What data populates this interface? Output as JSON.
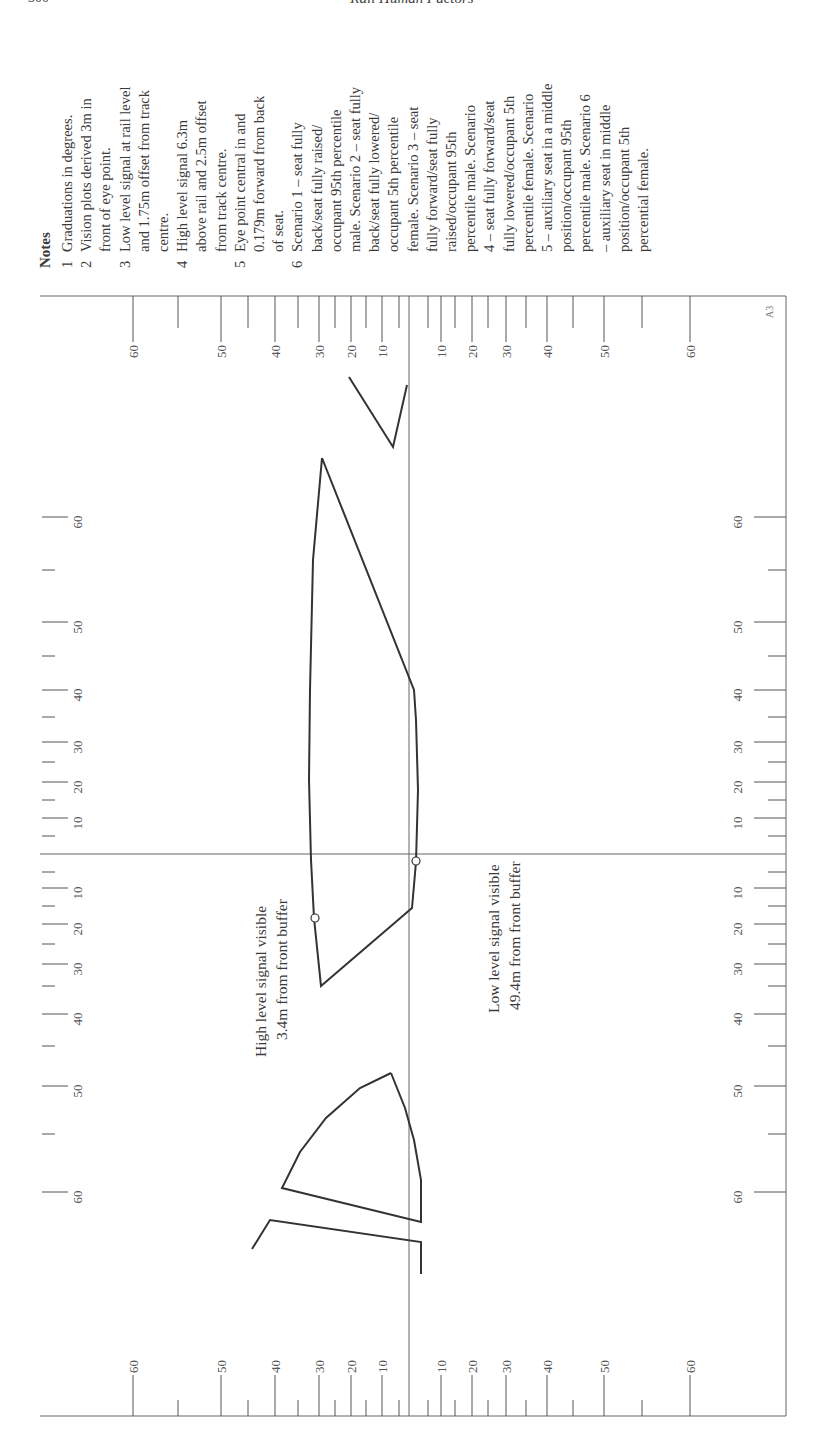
{
  "header": {
    "page_number": "300",
    "running_title": "Rail Human Factors"
  },
  "notes": {
    "heading": "Notes",
    "items": [
      {
        "num": "1",
        "lines": [
          "Graduations in degrees."
        ]
      },
      {
        "num": "2",
        "lines": [
          "Vision plots derived 3m in",
          "front of eye point."
        ]
      },
      {
        "num": "3",
        "lines": [
          "Low level signal at rail level",
          "and 1.75m offset from track",
          "centre."
        ]
      },
      {
        "num": "4",
        "lines": [
          "High level signal 6.3m",
          "above rail and 2.5m offset",
          "from track centre."
        ]
      },
      {
        "num": "5",
        "lines": [
          "Eye point central in and",
          "0.179m forward from back",
          "of seat."
        ]
      },
      {
        "num": "6",
        "lines": [
          "Scenario 1 – seat fully",
          "back/seat fully raised/",
          "occupant 95th percentile",
          "male. Scenario 2 – seat fully",
          "back/seat fully lowered/",
          "occupant 5th percentile",
          "female. Scenario 3 – seat",
          "fully forward/seat fully",
          "raised/occupant 95th",
          "percentile male. Scenario",
          "4 – seat fully forward/seat",
          "fully lowered/occupant 5th",
          "percentile female. Scenario",
          "5 – auxiliary seat in a middle",
          "position/occupant 95th",
          "percentile male. Scenario 6",
          "– auxiliary seat in middle",
          "position/occupant 5th",
          "percential female."
        ]
      }
    ]
  },
  "annotations": {
    "high_signal": [
      "High level signal visible",
      "3.4m from front buffer"
    ],
    "low_signal": [
      "Low level signal visible",
      "49.4m from front buffer"
    ],
    "corner_code": "A3"
  },
  "scales": {
    "major_labels": [
      "60",
      "50",
      "40",
      "30",
      "20",
      "10",
      "10",
      "20",
      "30",
      "40",
      "50",
      "60"
    ]
  },
  "colors": {
    "line": "#333333",
    "axis": "#666666",
    "text": "#3a3a3a"
  }
}
